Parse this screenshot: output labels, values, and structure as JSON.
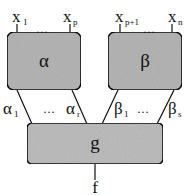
{
  "diagram": {
    "boxes": {
      "alpha": {
        "label": "α",
        "inputs": {
          "first": "x",
          "first_sub": "1",
          "dots": "…",
          "last": "x",
          "last_sub": "p"
        }
      },
      "beta": {
        "label": "β",
        "inputs": {
          "first": "x",
          "first_sub": "p+1",
          "dots": "…",
          "last": "x",
          "last_sub": "n"
        }
      },
      "g": {
        "label": "g"
      }
    },
    "edges": {
      "alpha_first": "α",
      "alpha_first_sub": "1",
      "alpha_dots": "…",
      "alpha_last": "α",
      "alpha_last_sub": "r",
      "beta_first": "β",
      "beta_first_sub": "1",
      "beta_dots": "…",
      "beta_last": "β",
      "beta_last_sub": "s"
    },
    "output": "f",
    "colors": {
      "box_fill": "#b5b5b5",
      "stroke": "#111111",
      "background": "#ffffff"
    }
  }
}
